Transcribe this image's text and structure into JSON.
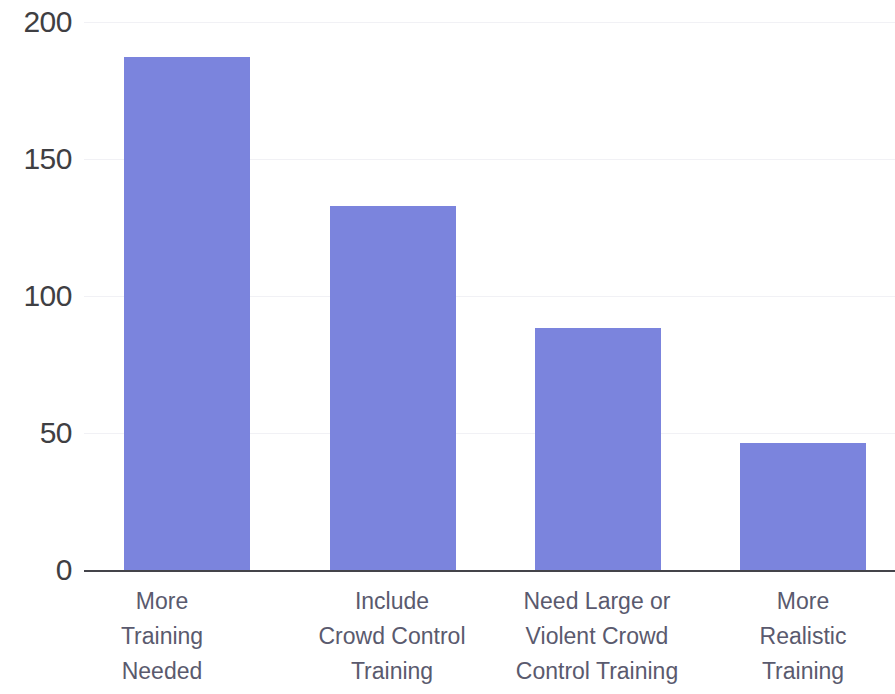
{
  "chart_data": {
    "type": "bar",
    "title": "",
    "subtitle": "",
    "xlabel": "",
    "ylabel": "",
    "categories": [
      "More Training Needed",
      "Include Crowd Control Training",
      "Need Large or Violent Crowd Control Training",
      "More Realistic Training"
    ],
    "category_lines": [
      [
        "More",
        "Training",
        "Needed"
      ],
      [
        "Include",
        "Crowd Control",
        "Training"
      ],
      [
        "Need Large or",
        "Violent Crowd",
        "Control Training"
      ],
      [
        "More",
        "Realistic",
        "Training"
      ]
    ],
    "values": [
      180,
      128,
      85,
      45
    ],
    "ylim": [
      0,
      200
    ],
    "yticks": [
      200,
      150,
      100,
      50,
      0
    ],
    "ytick_labels": [
      "200",
      "150",
      "100",
      "50",
      "0"
    ],
    "grid": true,
    "grid_axis": "y",
    "legend": false,
    "legend_position": "none",
    "series": [
      {
        "name": "Responses",
        "values": [
          180,
          128,
          85,
          45
        ]
      }
    ]
  },
  "colors": {
    "bar": "#7b84dd",
    "axis": "#44444a",
    "grid": "#f1f1f5",
    "ytick_text": "#3f3f43",
    "category_text": "#5a5a6e",
    "background": "#ffffff"
  }
}
